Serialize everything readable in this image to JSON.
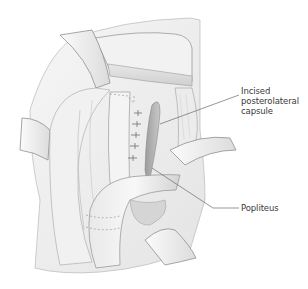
{
  "figure": {
    "type": "surgical-illustration",
    "colors": {
      "background": "#ffffff",
      "line": "#8a8a8a",
      "shade_light": "#efefef",
      "shade_mid": "#d6d6d6",
      "shade_dark": "#a9a9a9",
      "label_text": "#3a3a3a"
    }
  },
  "labels": [
    {
      "id": "incised-posterolateral-capsule",
      "lines": [
        "Incised",
        "posterolateral",
        "capsule"
      ],
      "x": 241,
      "y": 90,
      "leader": {
        "from": [
          239,
          95
        ],
        "to": [
          160,
          124
        ]
      }
    },
    {
      "id": "popliteus",
      "lines": [
        "Popliteus"
      ],
      "x": 241,
      "y": 204,
      "leader": {
        "from": [
          239,
          208
        ],
        "to": [
          213,
          208
        ],
        "bend_to": [
          152,
          168
        ]
      }
    }
  ]
}
